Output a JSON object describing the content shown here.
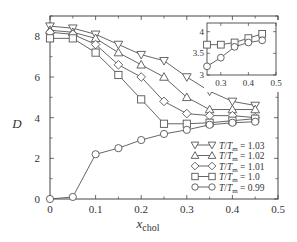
{
  "chart_data": {
    "type": "line",
    "title": "",
    "xlabel": "x_chol",
    "xlabel_main": "x",
    "xlabel_sub": "chol",
    "ylabel": "D",
    "xlim": [
      0,
      0.5
    ],
    "ylim": [
      0,
      9
    ],
    "xticks": [
      0,
      0.1,
      0.2,
      0.3,
      0.4,
      0.5
    ],
    "xtick_labels": [
      "0",
      "0.1",
      "0.2",
      "0.3",
      "0.4",
      "0.5"
    ],
    "yticks": [
      0,
      2,
      4,
      6,
      8
    ],
    "ytick_labels": [
      "0",
      "2",
      "4",
      "6",
      "8"
    ],
    "grid": false,
    "legend_position": "lower right",
    "x": [
      0,
      0.05,
      0.1,
      0.15,
      0.2,
      0.25,
      0.3,
      0.35,
      0.4,
      0.45
    ],
    "series": [
      {
        "name": "T/T_m = 1.03",
        "label_value": "= 1.03",
        "marker": "triangle-down",
        "values": [
          8.5,
          8.4,
          8.1,
          7.6,
          7.1,
          6.8,
          6.0,
          5.3,
          4.8,
          4.6
        ]
      },
      {
        "name": "T/T_m = 1.02",
        "label_value": "= 1.02",
        "marker": "triangle-up",
        "values": [
          8.3,
          8.2,
          7.9,
          7.2,
          6.6,
          6.0,
          5.0,
          4.4,
          4.4,
          4.4
        ]
      },
      {
        "name": "T/T_m = 1.01",
        "label_value": "= 1.01",
        "marker": "diamond",
        "values": [
          8.2,
          8.1,
          7.6,
          6.6,
          6.0,
          4.8,
          4.2,
          4.1,
          4.1,
          4.0
        ]
      },
      {
        "name": "T/T_m = 1.0",
        "label_value": "= 1.0",
        "marker": "square",
        "values": [
          7.9,
          7.9,
          7.2,
          6.1,
          4.9,
          3.7,
          3.7,
          3.75,
          3.85,
          3.95
        ]
      },
      {
        "name": "T/T_m = 0.99",
        "label_value": "= 0.99",
        "marker": "circle",
        "values": [
          0.0,
          0.1,
          2.2,
          2.5,
          2.9,
          3.2,
          3.4,
          3.65,
          3.75,
          3.8
        ]
      }
    ],
    "inset": {
      "type": "line",
      "xlim": [
        0.25,
        0.5
      ],
      "ylim": [
        3,
        4.2
      ],
      "xticks": [
        0.3,
        0.4,
        0.5
      ],
      "xtick_labels": [
        "0.3",
        "0.4",
        "0.5"
      ],
      "yticks": [
        3,
        3.5,
        4
      ],
      "ytick_labels": [
        "3",
        "3.5",
        "4"
      ],
      "x": [
        0.25,
        0.3,
        0.35,
        0.4,
        0.45
      ],
      "series": [
        {
          "name": "T/T_m = 1.0",
          "marker": "square",
          "values": [
            3.7,
            3.7,
            3.75,
            3.85,
            3.95
          ]
        },
        {
          "name": "T/T_m = 0.99",
          "marker": "circle",
          "values": [
            3.2,
            3.4,
            3.65,
            3.75,
            3.8
          ]
        }
      ]
    }
  },
  "colors": {
    "line": "#555555",
    "axis": "#444444",
    "text": "#333333",
    "background": "#ffffff"
  }
}
